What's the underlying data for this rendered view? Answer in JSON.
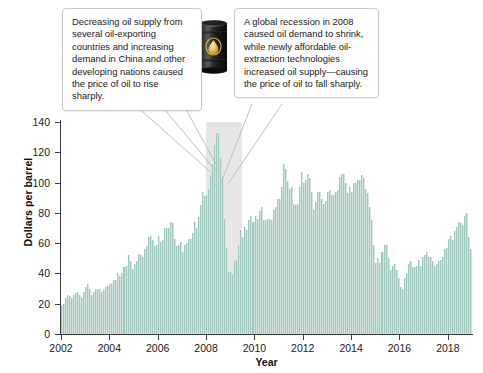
{
  "figure": {
    "background_color": "#ffffff",
    "bar_color": "#9ec8bd",
    "recession_band_color": "#e2e2e2",
    "axis_color": "#3f3f3f"
  },
  "callouts": [
    {
      "name": "supply-demand-callout",
      "text": "Decreasing oil supply from several oil-exporting countries and increasing demand in China and other developing nations caused the price of oil to rise sharply."
    },
    {
      "name": "recession-callout",
      "text": "A global recession in 2008 caused oil demand to shrink, while newly affordable oil-extraction technologies increased oil supply—causing the price of oil to fall sharply."
    }
  ],
  "icons": {
    "oil_drum": "oil-drum-icon",
    "oil_drop_emblem": "oil-drop-icon"
  },
  "chart_data": {
    "type": "bar",
    "title": "",
    "xlabel": "Year",
    "ylabel": "Dollars per barrel",
    "ylim": [
      0,
      140
    ],
    "xlim": [
      2002,
      2019
    ],
    "ytick_values": [
      0,
      20,
      40,
      60,
      80,
      100,
      120,
      140
    ],
    "ytick_labels": [
      "0",
      "20",
      "40",
      "60",
      "80",
      "100",
      "120",
      "140"
    ],
    "xtick_values": [
      2002,
      2004,
      2006,
      2008,
      2010,
      2012,
      2014,
      2016,
      2018
    ],
    "xtick_labels": [
      "2002",
      "2004",
      "2006",
      "2008",
      "2010",
      "2012",
      "2014",
      "2016",
      "2018"
    ],
    "grid": false,
    "legend": null,
    "series_name": "Crude oil price",
    "x_start": 2002.0,
    "x_step_years": 0.08333,
    "shaded_regions": [
      {
        "name": "recession-2008-2009",
        "x_start": 2008.0,
        "x_end": 2009.5,
        "color": "#e2e2e2"
      }
    ],
    "annotations": [
      {
        "text": "peak",
        "x": 2008.5,
        "y": 140
      },
      {
        "text": "trough",
        "x": 2009.0,
        "y": 40
      }
    ],
    "values": [
      19,
      20,
      24,
      26,
      25,
      24,
      26,
      27,
      28,
      26,
      24,
      28,
      31,
      33,
      30,
      26,
      28,
      30,
      30,
      30,
      28,
      29,
      31,
      32,
      33,
      34,
      36,
      36,
      40,
      38,
      40,
      44,
      45,
      52,
      48,
      43,
      46,
      48,
      53,
      52,
      51,
      56,
      58,
      64,
      65,
      62,
      58,
      59,
      65,
      61,
      62,
      70,
      70,
      70,
      74,
      73,
      63,
      58,
      59,
      61,
      54,
      59,
      60,
      63,
      63,
      67,
      74,
      70,
      77,
      85,
      94,
      91,
      92,
      95,
      105,
      112,
      125,
      133,
      133,
      116,
      104,
      76,
      57,
      41,
      41,
      39,
      48,
      49,
      59,
      69,
      64,
      71,
      69,
      75,
      78,
      74,
      78,
      76,
      81,
      84,
      75,
      75,
      76,
      76,
      75,
      82,
      84,
      89,
      89,
      97,
      112,
      109,
      101,
      96,
      97,
      86,
      85,
      86,
      97,
      107,
      100,
      102,
      106,
      103,
      94,
      82,
      87,
      94,
      94,
      89,
      86,
      88,
      94,
      95,
      92,
      92,
      94,
      95,
      104,
      106,
      106,
      100,
      93,
      97,
      94,
      100,
      100,
      102,
      102,
      105,
      103,
      96,
      93,
      84,
      75,
      59,
      47,
      50,
      47,
      54,
      59,
      59,
      50,
      42,
      45,
      46,
      42,
      37,
      31,
      30,
      37,
      40,
      46,
      48,
      44,
      44,
      45,
      49,
      45,
      51,
      52,
      54,
      51,
      51,
      48,
      45,
      46,
      48,
      49,
      51,
      56,
      57,
      63,
      65,
      62,
      68,
      71,
      74,
      73,
      72,
      78,
      80,
      64,
      56
    ]
  }
}
